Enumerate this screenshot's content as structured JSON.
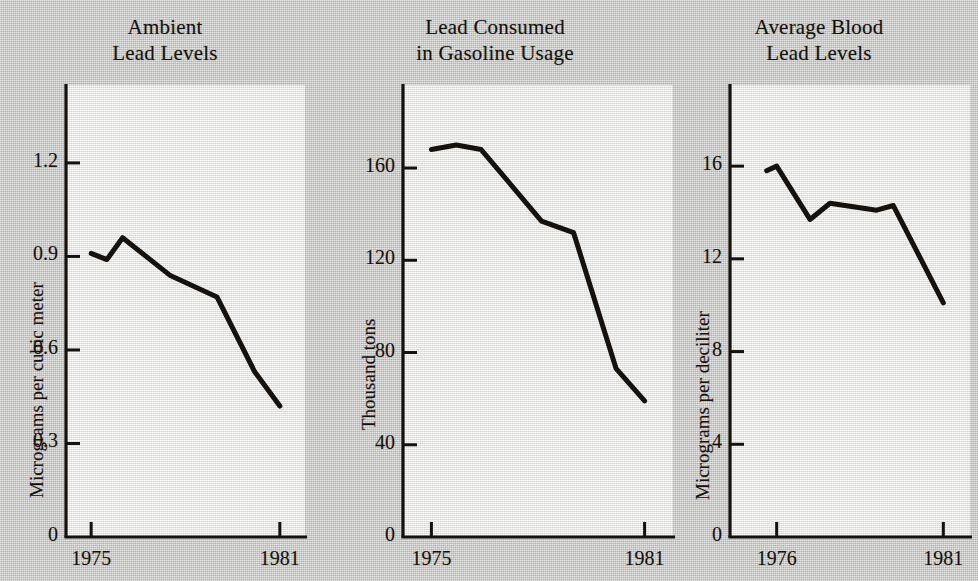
{
  "figure": {
    "background_color": "#c9c9c6",
    "plot_background_color": "#e9e9e6",
    "ink_color": "#15120d",
    "panel_count": 3
  },
  "chart_data": [
    {
      "type": "line",
      "title": "Ambient Lead Levels",
      "title_line1": "Ambient",
      "title_line2": "Lead Levels",
      "xlabel": "",
      "ylabel": "Micrograms per cubic meter",
      "x": [
        1975,
        1975.5,
        1976,
        1977.5,
        1979,
        1980.2,
        1981
      ],
      "values": [
        0.91,
        0.89,
        0.96,
        0.84,
        0.77,
        0.53,
        0.42
      ],
      "xlim": [
        1974.2,
        1981.8
      ],
      "ylim": [
        0,
        1.45
      ],
      "yticks": [
        0,
        0.3,
        0.6,
        0.9,
        1.2
      ],
      "ytick_labels": [
        "0",
        "0.3",
        "0.6",
        "0.9",
        "1.2"
      ],
      "xticks": [
        1975,
        1981
      ],
      "xtick_labels": [
        "1975",
        "1981"
      ],
      "grid": false,
      "legend": "none"
    },
    {
      "type": "line",
      "title": "Lead Consumed in Gasoline Usage",
      "title_line1": "Lead Consumed",
      "title_line2": "in Gasoline Usage",
      "xlabel": "",
      "ylabel": "Thousand tons",
      "x": [
        1975,
        1975.7,
        1976.4,
        1978.1,
        1979.0,
        1980.2,
        1981
      ],
      "values": [
        168,
        170,
        168,
        137,
        132,
        73,
        59
      ],
      "xlim": [
        1974.2,
        1981.8
      ],
      "ylim": [
        0,
        196
      ],
      "yticks": [
        0,
        40,
        80,
        120,
        160
      ],
      "ytick_labels": [
        "0",
        "40",
        "80",
        "120",
        "160"
      ],
      "xticks": [
        1975,
        1981
      ],
      "xtick_labels": [
        "1975",
        "1981"
      ],
      "grid": false,
      "legend": "none"
    },
    {
      "type": "line",
      "title": "Average Blood Lead Levels",
      "title_line1": "Average Blood",
      "title_line2": "Lead Levels",
      "xlabel": "",
      "ylabel": "Micrograms per deciliter",
      "x": [
        1975.7,
        1976,
        1977,
        1977.6,
        1979,
        1979.5,
        1981
      ],
      "values": [
        15.8,
        16.0,
        13.7,
        14.4,
        14.1,
        14.3,
        10.1
      ],
      "xlim": [
        1974.6,
        1981.8
      ],
      "ylim": [
        0,
        19.5
      ],
      "yticks": [
        0,
        4,
        8,
        12,
        16
      ],
      "ytick_labels": [
        "0",
        "4",
        "8",
        "12",
        "16"
      ],
      "xticks": [
        1976,
        1981
      ],
      "xtick_labels": [
        "1976",
        "1981"
      ],
      "grid": false,
      "legend": "none"
    }
  ]
}
